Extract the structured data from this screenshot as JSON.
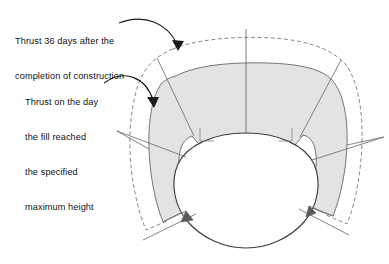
{
  "figure": {
    "type": "engineering-cross-section-diagram",
    "background_color": "#ffffff",
    "fill_color": "#e3e3e3",
    "line_color": "#555555",
    "outline_color": "#333333",
    "text_color": "#111111"
  },
  "annotations": {
    "late": {
      "name": "thrust-36-days-label",
      "line1": "Thrust 36 days after the",
      "line2": "completion of construction",
      "text": "Thrust 36 days after the completion of construction",
      "points_to": "dashed-outer-envelope"
    },
    "early": {
      "name": "thrust-max-fill-height-label",
      "line1": "Thrust on the day",
      "line2": "the fill reached",
      "line3": "the specified",
      "line4": "maximum height",
      "text": "Thrust on the day the fill reached the specified maximum height",
      "points_to": "solid-shaded-envelope"
    }
  },
  "elements": {
    "outer_envelope": {
      "name": "dashed-outer-envelope",
      "style": "dashed",
      "label_ref": "late"
    },
    "inner_envelope": {
      "name": "solid-shaded-envelope",
      "style": "solid-filled",
      "label_ref": "early"
    },
    "tunnel": {
      "name": "tunnel-lining-ellipse",
      "style": "solid-outline"
    },
    "centerline": {
      "name": "vertical-centerline",
      "style": "solid-thin"
    },
    "radials": {
      "name": "radial-division-lines",
      "count": 8
    },
    "corner_arrows": {
      "name": "thrust-direction-arrowheads",
      "count": 2,
      "positions": [
        "bottom-left",
        "bottom-right"
      ]
    }
  }
}
